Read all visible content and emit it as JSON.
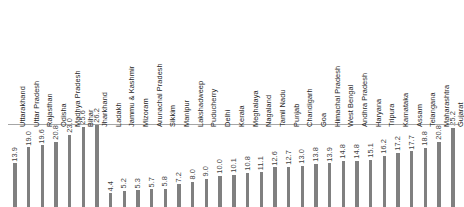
{
  "chart_data": {
    "type": "bar",
    "title": "",
    "subtitle": "",
    "xlabel": "",
    "ylabel": "",
    "ylim": [
      0,
      28
    ],
    "grid": false,
    "legend": null,
    "orientation": "vertical",
    "bar_color": "#808080",
    "axis_color": "#a6a6a6",
    "label_color": "#262626",
    "value_label_color": "#3f3f3f",
    "value_labels_rotated": true,
    "tick_labels_rotated": true,
    "categories": [
      "Uttarakhand",
      "Uttar Pradesh",
      "Rajasthan",
      "Odisha",
      "Madhya Pradesh",
      "Bihar",
      "Jharkhand",
      "Ladakh",
      "Jammu & Kashmir",
      "Mizoram",
      "Arunachal Pradesh",
      "Sikkim",
      "Manipur",
      "Lakshadweep",
      "Puducherry",
      "Delhi",
      "Kerala",
      "Meghalaya",
      "Nagaland",
      "Tamil Nadu",
      "Punjab",
      "Chandigarh",
      "Goa",
      "Himachal Pradesh",
      "West Bengal",
      "Andhra Pradesh",
      "Haryana",
      "Tripura",
      "Karnataka",
      "Assam",
      "Telangana",
      "Maharashtra",
      "Gujarat"
    ],
    "values": [
      13.9,
      19.0,
      19.6,
      20.8,
      23.0,
      25.6,
      26.2,
      4.4,
      5.2,
      5.3,
      5.7,
      5.8,
      7.2,
      8.0,
      9.0,
      10.0,
      10.1,
      10.8,
      11.1,
      12.6,
      12.7,
      13.0,
      13.8,
      13.9,
      14.8,
      14.8,
      15.1,
      16.2,
      17.2,
      17.7,
      18.8,
      20.8,
      25.2
    ],
    "value_labels": [
      "13.9",
      "19.0",
      "19.6",
      "20.8",
      "23.0",
      "25.6",
      "26.2",
      "4.4",
      "5.2",
      "5.3",
      "5.7",
      "5.8",
      "7.2",
      "8.0",
      "9.0",
      "10.0",
      "10.1",
      "10.8",
      "11.1",
      "12.6",
      "12.7",
      "13.0",
      "13.8",
      "13.9",
      "14.8",
      "14.8",
      "15.1",
      "16.2",
      "17.2",
      "17.7",
      "18.8",
      "20.8",
      "25.2"
    ]
  }
}
